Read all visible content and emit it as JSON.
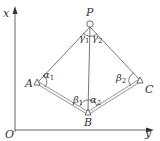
{
  "diagram": {
    "type": "survey-traverse-geometry",
    "axes": {
      "origin_label": "O",
      "vertical_axis_label": "x",
      "horizontal_axis_label": "y"
    },
    "points": [
      {
        "id": "P",
        "label": "P"
      },
      {
        "id": "A",
        "label": "A"
      },
      {
        "id": "B",
        "label": "B"
      },
      {
        "id": "C",
        "label": "C"
      }
    ],
    "edges": [
      {
        "from": "P",
        "to": "A",
        "style": "single"
      },
      {
        "from": "P",
        "to": "B",
        "style": "single"
      },
      {
        "from": "P",
        "to": "C",
        "style": "single"
      },
      {
        "from": "A",
        "to": "B",
        "style": "double"
      },
      {
        "from": "B",
        "to": "C",
        "style": "double"
      }
    ],
    "angles": {
      "gamma1": {
        "symbol": "γ",
        "sub": "1"
      },
      "gamma2": {
        "symbol": "γ",
        "sub": "2"
      },
      "alpha1": {
        "symbol": "α",
        "sub": "1"
      },
      "alpha2": {
        "symbol": "α",
        "sub": "2"
      },
      "beta1": {
        "symbol": "β",
        "sub": "1"
      },
      "beta2": {
        "symbol": "β",
        "sub": "2"
      }
    },
    "colors": {
      "line": "#555555",
      "text": "#333333",
      "background": "#ffffff"
    }
  }
}
